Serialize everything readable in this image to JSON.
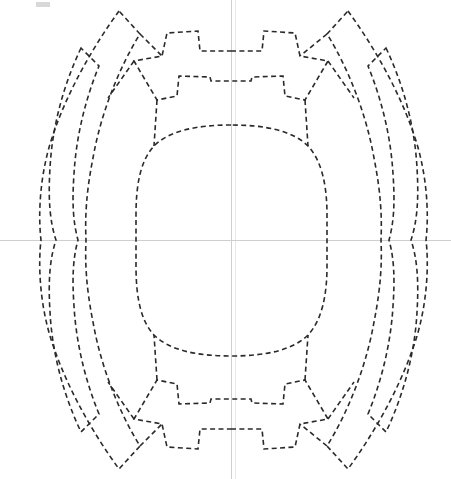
{
  "document": {
    "title": "Dashed symmetric gear-wing pattern outline",
    "background_color": "#ffffff",
    "width": 451,
    "height": 479
  },
  "style": {
    "stroke_color": "#2a2a2a",
    "stroke_width": 1.6,
    "dash_pattern": "5 3.4",
    "axis_color": "#cfcfcf",
    "axis_faint_color": "#e8e8e8",
    "corner_mark_color": "#d8d8d8"
  },
  "axes": {
    "origin_x": 231,
    "origin_y": 240,
    "vertical": {
      "x": 231,
      "y1": 0,
      "y2": 479
    },
    "horizontal": {
      "y": 240,
      "x1": 0,
      "x2": 451
    },
    "vertical_faint": {
      "x": 235,
      "y1": 0,
      "y2": 479
    }
  },
  "corner_mark": {
    "x": 36,
    "y": 2,
    "width": 14,
    "height": 5
  },
  "shapes": {
    "center_squircle": {
      "name": "central-rounded-body",
      "bbox": [
        136,
        125,
        327,
        356
      ],
      "d": "M 231 125 C 196 125 169 131 154 146 C 140 161 136 186 136 215 L 136 266 C 136 295 140 320 154 335 C 169 350 196 356 231 356 C 266 356 293 350 308 335 C 322 320 327 295 327 266 L 327 215 C 327 186 322 161 308 146 C 293 131 266 125 231 125 Z"
    },
    "wing_outer_left": {
      "name": "outer-wing-left",
      "d": "M 119 11 C 95 44 66 92 50 144 C 40 178 38 214 41 240 C 38 266 40 302 50 336 C 66 388 95 436 119 469 L 140 446 C 120 414 101 368 93 322 C 86 287 85 262 86 240 C 85 218 86 193 93 158 C 101 112 120 66 140 34 Z"
    },
    "wing_inner_left": {
      "name": "inner-wing-left",
      "d": "M 81 48 C 63 86 52 128 50 168 C 48 200 50 222 56 240 C 50 258 48 280 50 312 C 52 352 63 394 81 432 L 99 414 C 85 380 76 342 74 306 C 72 278 73 258 78 240 C 73 222 72 202 74 174 C 76 138 85 100 99 66 Z"
    },
    "wing_outer_right": {
      "name": "outer-wing-right",
      "d": "M 348 11 C 372 44 401 92 417 144 C 427 178 429 214 426 240 C 429 266 427 302 417 336 C 401 388 372 436 348 469 L 327 446 C 347 414 366 368 374 322 C 381 287 382 262 381 240 C 382 218 381 193 374 158 C 366 112 347 66 327 34 Z"
    },
    "wing_inner_right": {
      "name": "inner-wing-right",
      "d": "M 386 48 C 404 86 415 128 417 168 C 419 200 417 222 411 240 C 417 258 419 280 417 312 C 415 352 404 394 386 432 L 368 414 C 382 380 391 342 393 306 C 395 278 394 258 389 240 C 394 222 395 202 393 174 C 391 138 382 100 368 66 Z"
    },
    "gear_teeth_top": {
      "name": "gear-teeth-top",
      "d": "M 231 51 L 262 51 L 264 31 L 295 33 L 300 56 L 328 61 L 305 100 L 285 96 L 283 76 L 252 77 L 251 81 L 231 81 L 211 81 L 210 77 L 179 76 L 177 96 L 157 100 L 134 61 L 162 56 L 167 33 L 198 31 L 200 51 Z"
    },
    "gear_teeth_bottom": {
      "name": "gear-teeth-bottom",
      "d": "M 231 429 L 262 429 L 264 449 L 295 447 L 300 424 L 328 419 L 305 380 L 285 384 L 283 404 L 252 403 L 251 399 L 231 399 L 211 399 L 210 403 L 179 404 L 177 384 L 157 380 L 134 419 L 162 424 L 167 447 L 198 449 L 200 429 Z"
    },
    "spokes": {
      "name": "connector-spokes",
      "paths": [
        "M 140 34 L 162 56",
        "M 157 100 L 154 146",
        "M 134 61 L 108 98",
        "M 140 446 L 162 424",
        "M 157 380 L 154 335",
        "M 134 419 L 108 382",
        "M 327 34 L 300 56",
        "M 305 100 L 308 146",
        "M 328 61 L 354 98",
        "M 327 446 L 300 424",
        "M 305 380 L 308 335",
        "M 328 419 L 354 382"
      ]
    }
  }
}
